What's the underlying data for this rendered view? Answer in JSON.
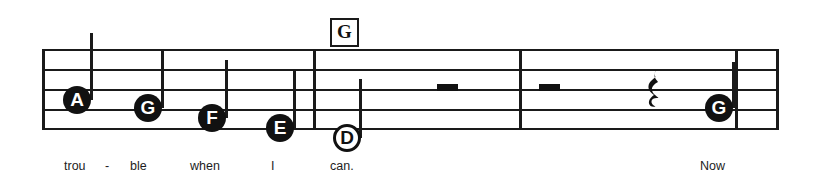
{
  "sheet": {
    "width": 814,
    "height": 190,
    "background": "#ffffff",
    "ink_color": "#111111"
  },
  "staff": {
    "name": "five-line-staff",
    "left": 42,
    "right": 779,
    "line_count": 5,
    "line_y": [
      49,
      69,
      89,
      109,
      128
    ],
    "line_thickness": 2,
    "barline_x": [
      313,
      519,
      735
    ],
    "barline_color": "#1a1a1a"
  },
  "chord_symbols": [
    {
      "label": "G",
      "x": 330,
      "y": 18
    }
  ],
  "notes": [
    {
      "label": "A",
      "style": "filled",
      "cx": 77,
      "cy": 100,
      "radius": 14,
      "stem": "up",
      "stem_x": 90,
      "stem_top": 33,
      "stem_bottom": 100,
      "lyric": "trou"
    },
    {
      "label": "G",
      "style": "filled",
      "cx": 148,
      "cy": 108,
      "radius": 14,
      "stem": "up",
      "stem_x": 161,
      "stem_top": 49,
      "stem_bottom": 108,
      "lyric": "ble"
    },
    {
      "label": "F",
      "style": "filled",
      "cx": 212,
      "cy": 118,
      "radius": 14,
      "stem": "up",
      "stem_x": 225,
      "stem_top": 60,
      "stem_bottom": 118,
      "lyric": "when"
    },
    {
      "label": "E",
      "style": "filled",
      "cx": 280,
      "cy": 128,
      "radius": 14,
      "stem": "up",
      "stem_x": 293,
      "stem_top": 70,
      "stem_bottom": 128,
      "lyric": "I"
    },
    {
      "label": "D",
      "style": "hollow",
      "cx": 347,
      "cy": 138,
      "radius": 14,
      "stem": "up",
      "stem_x": 359,
      "stem_top": 79,
      "stem_bottom": 138,
      "lyric": "can."
    },
    {
      "label": "G",
      "style": "filled",
      "cx": 719,
      "cy": 108,
      "radius": 14,
      "stem": "up",
      "stem_x": 732,
      "stem_top": 62,
      "stem_bottom": 108,
      "lyric": "Now"
    }
  ],
  "rests": [
    {
      "kind": "bar-rest",
      "x": 437,
      "y": 84,
      "width": 21,
      "height": 7
    },
    {
      "kind": "bar-rest",
      "x": 539,
      "y": 84,
      "width": 21,
      "height": 7
    },
    {
      "kind": "quarter-rest",
      "glyph": "♩",
      "x": 643,
      "y": 68
    }
  ],
  "lyrics": [
    {
      "text": "trou",
      "x": 64,
      "y": 159
    },
    {
      "text": "-",
      "x": 105,
      "y": 159
    },
    {
      "text": "ble",
      "x": 130,
      "y": 159
    },
    {
      "text": "when",
      "x": 190,
      "y": 159
    },
    {
      "text": "I",
      "x": 271,
      "y": 159
    },
    {
      "text": "can.",
      "x": 330,
      "y": 159
    },
    {
      "text": "Now",
      "x": 700,
      "y": 159
    }
  ]
}
